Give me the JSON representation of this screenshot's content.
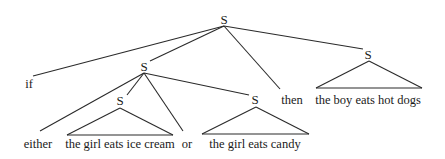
{
  "nodes": {
    "root": "S",
    "antecedent": "S",
    "consequent": "S",
    "disjunct_left": "S",
    "disjunct_right": "S"
  },
  "words": {
    "if": "if",
    "then": "then",
    "either": "either",
    "or": "or"
  },
  "phrases": {
    "disjunct_left": "the girl eats ice cream",
    "disjunct_right": "the girl eats candy",
    "consequent": "the boy eats hot dogs"
  },
  "colors": {
    "line": "#2a2a2a",
    "text": "#1a1a1a",
    "background": "#ffffff"
  }
}
